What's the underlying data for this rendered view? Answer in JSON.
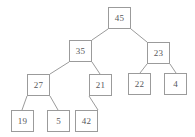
{
  "diagram": {
    "type": "binary-tree",
    "title": "",
    "colors": {
      "background": "#ffffff",
      "node_fill": "#ffffff",
      "node_border": "#9b9b9b",
      "node_text": "#56575a",
      "edge": "#9b9b9b"
    },
    "nodes": [
      {
        "id": "n45",
        "label": "45",
        "x": 108,
        "y": 7,
        "w": 23,
        "h": 22
      },
      {
        "id": "n35",
        "label": "35",
        "x": 69,
        "y": 40,
        "w": 23,
        "h": 22
      },
      {
        "id": "n23",
        "label": "23",
        "x": 147,
        "y": 42,
        "w": 23,
        "h": 22
      },
      {
        "id": "n27",
        "label": "27",
        "x": 27,
        "y": 74,
        "w": 23,
        "h": 22
      },
      {
        "id": "n21",
        "label": "21",
        "x": 89,
        "y": 74,
        "w": 23,
        "h": 22
      },
      {
        "id": "n22",
        "label": "22",
        "x": 128,
        "y": 73,
        "w": 23,
        "h": 22
      },
      {
        "id": "n4",
        "label": "4",
        "x": 164,
        "y": 73,
        "w": 23,
        "h": 22
      },
      {
        "id": "n19",
        "label": "19",
        "x": 11,
        "y": 110,
        "w": 23,
        "h": 22
      },
      {
        "id": "n5",
        "label": "5",
        "x": 47,
        "y": 110,
        "w": 23,
        "h": 22
      },
      {
        "id": "n42",
        "label": "42",
        "x": 75,
        "y": 110,
        "w": 23,
        "h": 22
      }
    ],
    "edges": [
      {
        "from": "n45",
        "to": "n35",
        "x1": 108,
        "y1": 29,
        "x2": 92,
        "y2": 40
      },
      {
        "from": "n45",
        "to": "n23",
        "x1": 131,
        "y1": 29,
        "x2": 147,
        "y2": 42
      },
      {
        "from": "n35",
        "to": "n27",
        "x1": 69,
        "y1": 62,
        "x2": 50,
        "y2": 74
      },
      {
        "from": "n35",
        "to": "n21",
        "x1": 92,
        "y1": 62,
        "x2": 100,
        "y2": 74
      },
      {
        "from": "n23",
        "to": "n22",
        "x1": 147,
        "y1": 64,
        "x2": 140,
        "y2": 73
      },
      {
        "from": "n23",
        "to": "n4",
        "x1": 170,
        "y1": 64,
        "x2": 176,
        "y2": 73
      },
      {
        "from": "n27",
        "to": "n19",
        "x1": 27,
        "y1": 96,
        "x2": 22,
        "y2": 110
      },
      {
        "from": "n27",
        "to": "n5",
        "x1": 50,
        "y1": 96,
        "x2": 58,
        "y2": 110
      },
      {
        "from": "n21",
        "to": "n42",
        "x1": 89,
        "y1": 96,
        "x2": 98,
        "y2": 110
      }
    ]
  }
}
